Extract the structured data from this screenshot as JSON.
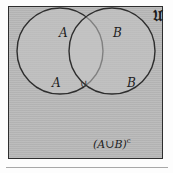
{
  "figure": {
    "type": "venn-diagram",
    "universe_symbol": "U",
    "universe_symbol_display": "𝔘",
    "complement_label": "(A∪B)",
    "complement_superscript": "c",
    "intersection_symbol": "∪",
    "set_a_outer_label": "A",
    "set_b_outer_label": "B",
    "set_a_inner_label": "A",
    "set_b_inner_label": "B"
  },
  "colors": {
    "background": "#fdfdfd",
    "universe_fill": "#b9b9b9",
    "circle_fill": "#c4c4c4",
    "stroke": "#2e2e2e",
    "text": "#1d1d1d",
    "rule": "#a8a8a8"
  },
  "geometry": {
    "box": {
      "x": 8,
      "y": 6,
      "width": 155,
      "height": 153
    },
    "circle_a": {
      "cx": 52,
      "cy": 45,
      "r": 43
    },
    "circle_b": {
      "cx": 104,
      "cy": 45,
      "r": 43
    }
  }
}
